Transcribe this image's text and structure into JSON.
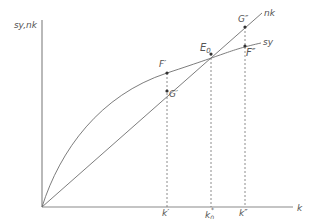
{
  "diagram": {
    "type": "solow-growth-diagram",
    "y_axis_label": "sy,nk",
    "x_axis_label": "k",
    "curves": [
      {
        "id": "nk",
        "label": "nk",
        "kind": "straight line from origin"
      },
      {
        "id": "sy",
        "label": "sy",
        "kind": "concave curve from origin"
      }
    ],
    "points": [
      {
        "id": "E0",
        "label": "E",
        "subscript": "0",
        "on": [
          "nk",
          "sy"
        ]
      },
      {
        "id": "F1",
        "label": "F′",
        "on": [
          "sy"
        ]
      },
      {
        "id": "G1",
        "label": "G′",
        "on": [
          "nk"
        ]
      },
      {
        "id": "G2",
        "label": "G″",
        "on": [
          "nk"
        ]
      },
      {
        "id": "F2",
        "label": "F″",
        "on": [
          "sy"
        ]
      }
    ],
    "x_ticks": [
      {
        "id": "k1",
        "label": "k′"
      },
      {
        "id": "k0",
        "label": "k",
        "subscript": "0",
        "superscript": "*"
      },
      {
        "id": "k2",
        "label": "k″"
      }
    ],
    "colors": {
      "axis": "#8a8a8a",
      "curve": "#6e6e6e",
      "text": "#555555",
      "point": "#333333"
    }
  }
}
